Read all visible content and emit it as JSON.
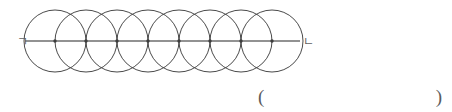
{
  "figure": {
    "left_endpoint_label": "ㄱ",
    "right_endpoint_label": "ㄴ",
    "circle_count": 8,
    "circle_radius_px": 31,
    "center_spacing_px": 31,
    "first_center_x": 55,
    "baseline_y": 41,
    "line_start_x": 25,
    "line_end_x": 300,
    "centers_x": [
      55,
      86,
      117,
      148,
      179,
      210,
      241,
      272
    ],
    "stroke_color": "#4a4a4a",
    "line_color": "#6e6e6e",
    "dot_color": "#3c3c3c",
    "label_color": "#5f5f5f",
    "background_color": "#ffffff"
  },
  "answer": {
    "open_paren": "(",
    "blank_value": "",
    "close_paren": ")"
  }
}
